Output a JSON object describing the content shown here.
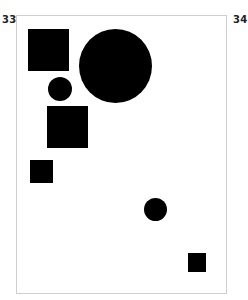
{
  "page_numbers": {
    "left": "33",
    "right": "34"
  },
  "colors": {
    "shape_fill": "#000000",
    "frame_border": "#cfcfcf",
    "background": "#ffffff"
  },
  "shapes": [
    {
      "type": "square",
      "x": 28,
      "y": 29,
      "w": 41,
      "h": 42
    },
    {
      "type": "circle",
      "x": 79,
      "y": 29,
      "w": 73,
      "h": 74
    },
    {
      "type": "circle",
      "x": 48,
      "y": 77,
      "w": 24,
      "h": 24
    },
    {
      "type": "square",
      "x": 47,
      "y": 106,
      "w": 41,
      "h": 42
    },
    {
      "type": "square",
      "x": 30,
      "y": 160,
      "w": 23,
      "h": 23
    },
    {
      "type": "circle",
      "x": 144,
      "y": 198,
      "w": 23,
      "h": 23
    },
    {
      "type": "square",
      "x": 188,
      "y": 253,
      "w": 18,
      "h": 19
    }
  ]
}
